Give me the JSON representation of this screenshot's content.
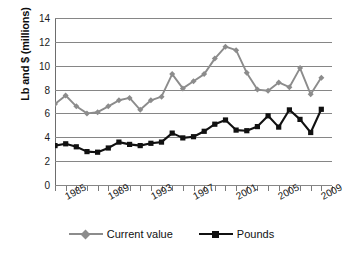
{
  "chart_data": {
    "type": "line",
    "title": "",
    "xlabel": "",
    "ylabel": "Lb and $ (millions)",
    "ylim": [
      0,
      14
    ],
    "ytick_step": 2,
    "yticks": [
      0,
      2,
      4,
      6,
      8,
      10,
      12,
      14
    ],
    "grid": true,
    "legend_position": "bottom",
    "x": [
      1983,
      1984,
      1985,
      1986,
      1987,
      1988,
      1989,
      1990,
      1991,
      1992,
      1993,
      1994,
      1995,
      1996,
      1997,
      1998,
      1999,
      2000,
      2001,
      2002,
      2003,
      2004,
      2005,
      2006,
      2007,
      2008
    ],
    "xtick_labels": [
      "1985",
      "1989",
      "1993",
      "1997",
      "2001",
      "2005",
      "2009"
    ],
    "xtick_label_years": [
      1985,
      1989,
      1993,
      1997,
      2001,
      2005,
      2009
    ],
    "xlim": [
      1983,
      2009
    ],
    "series": [
      {
        "name": "Current value",
        "color": "#8c8c8c",
        "marker": "diamond",
        "values": [
          6.8,
          7.5,
          6.6,
          6.0,
          6.1,
          6.6,
          7.1,
          7.3,
          6.3,
          7.1,
          7.4,
          9.3,
          8.1,
          8.7,
          9.3,
          10.6,
          11.6,
          11.3,
          9.4,
          8.0,
          7.9,
          8.6,
          8.2,
          9.8,
          7.6,
          9.0
        ]
      },
      {
        "name": "Pounds",
        "color": "#111111",
        "marker": "square",
        "values": [
          3.3,
          3.45,
          3.2,
          2.8,
          2.75,
          3.1,
          3.6,
          3.4,
          3.3,
          3.5,
          3.6,
          4.35,
          3.95,
          4.05,
          4.5,
          5.1,
          5.45,
          4.6,
          4.55,
          4.9,
          5.8,
          4.85,
          6.3,
          5.5,
          4.4,
          6.35
        ]
      }
    ]
  },
  "legend": {
    "entries": [
      {
        "label": "Current value"
      },
      {
        "label": "Pounds"
      }
    ]
  }
}
